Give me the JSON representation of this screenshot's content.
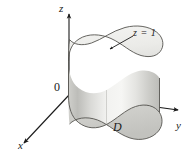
{
  "figure": {
    "background_color": "#ffffff",
    "ink_color": "#1a1a1a",
    "axes": {
      "origin_label": "0",
      "z_label": "z",
      "x_label": "x",
      "y_label": "y"
    },
    "annotations": {
      "top_surface": "z = 1",
      "base_region": "D"
    },
    "surfaces": {
      "top_face_color": "#eeeeec",
      "lateral_light_color": "#f4f4f2",
      "lateral_mid_color": "#d7d7d4",
      "lateral_dark_color": "#b9b9b5",
      "base_face_color": "#cfcfcb",
      "outline_color": "#55544f"
    }
  }
}
